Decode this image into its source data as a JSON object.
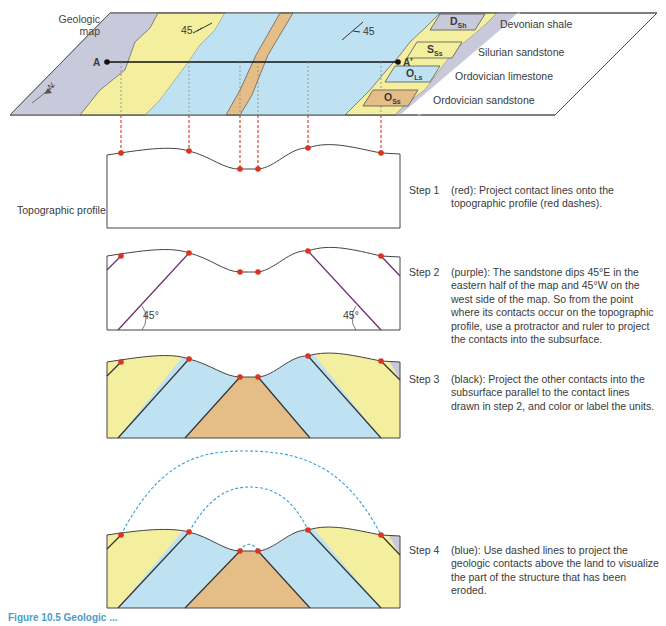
{
  "map": {
    "title_line1": "Geologic",
    "title_line2": "map",
    "point_a": "A",
    "point_a_prime": "A′",
    "dip_left": "45",
    "dip_right": "45",
    "north_arrow": "N"
  },
  "legend": {
    "items": [
      {
        "symbol": "D",
        "sub": "Sh",
        "label": "Devonian shale",
        "color": "#c9c9dc"
      },
      {
        "symbol": "S",
        "sub": "Ss",
        "label": "Silurian sandstone",
        "color": "#f3ef9e"
      },
      {
        "symbol": "O",
        "sub": "Ls",
        "label": "Ordovician limestone",
        "color": "#bfe2f2"
      },
      {
        "symbol": "O",
        "sub": "Ss",
        "label": "Ordovician sandstone",
        "color": "#e5bd87"
      }
    ]
  },
  "profile": {
    "label": "Topographic profile",
    "angle_left": "45°",
    "angle_right": "45°"
  },
  "steps": [
    {
      "label": "Step 1",
      "text": "(red): Project contact lines onto the topographic profile (red dashes)."
    },
    {
      "label": "Step 2",
      "text": "(purple): The sandstone dips 45°E in the eastern half of the map and 45°W on the west side of the map. So from the point where its contacts occur on the topographic profile, use a protractor and ruler to project the contacts into the subsurface."
    },
    {
      "label": "Step 3",
      "text": "(black): Project the other contacts into the subsurface parallel to the contact lines drawn in step 2, and color or label the units."
    },
    {
      "label": "Step 4",
      "text": "(blue): Use dashed lines to project the geologic contacts above the land to visualize the part of the structure that has been eroded."
    }
  ],
  "caption": "Figure 10.5 Geologic ...",
  "colors": {
    "shale": "#c9c9dc",
    "silurian_sandstone": "#f3ef9e",
    "limestone": "#bfe2f2",
    "ordovician_sandstone": "#e5bd87",
    "contact_red": "#d9341f",
    "dip_purple": "#6a2f6e",
    "projection_blue": "#3a9fd0"
  }
}
